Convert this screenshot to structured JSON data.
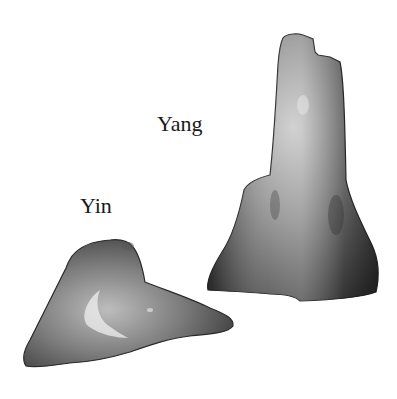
{
  "labels": {
    "yang": "Yang",
    "yin": "Yin"
  },
  "objects": [
    {
      "name": "yang-stone",
      "label": "Yang",
      "description": "tall upright stone"
    },
    {
      "name": "yin-stone",
      "label": "Yin",
      "description": "low flat stone"
    }
  ],
  "colors": {
    "background": "#ffffff",
    "stone_dark": "#3a3a3a",
    "stone_mid": "#7a7a7a",
    "stone_light": "#d8d8d8",
    "text": "#1a1a1a"
  }
}
